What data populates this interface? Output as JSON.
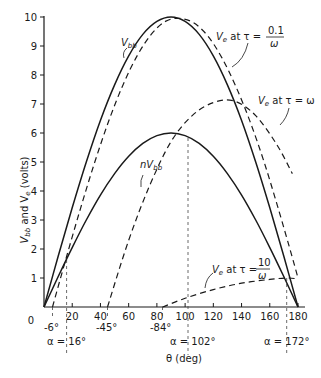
{
  "chart_data": {
    "type": "line",
    "title": "",
    "xlabel": "θ (deg)",
    "ylabel": "V_bb and V_e (volts)",
    "xlim": [
      0,
      180
    ],
    "ylim": [
      0,
      10
    ],
    "x_ticks": [
      0,
      20,
      40,
      60,
      80,
      100,
      120,
      140,
      160,
      180
    ],
    "y_ticks": [
      0,
      1,
      2,
      3,
      4,
      5,
      6,
      7,
      8,
      9,
      10
    ],
    "grid": false,
    "series": [
      {
        "name": "V_bb",
        "style": "solid",
        "x": [
          0,
          10,
          20,
          30,
          40,
          50,
          60,
          70,
          80,
          90,
          100,
          110,
          120,
          130,
          140,
          150,
          160,
          170,
          180
        ],
        "y": [
          0,
          1.74,
          3.42,
          5.0,
          6.43,
          7.66,
          8.66,
          9.4,
          9.85,
          10.0,
          9.85,
          9.4,
          8.66,
          7.66,
          6.43,
          5.0,
          3.42,
          1.74,
          0
        ]
      },
      {
        "name": "nV_bb",
        "style": "solid",
        "x": [
          0,
          10,
          20,
          30,
          40,
          50,
          60,
          70,
          80,
          90,
          100,
          110,
          120,
          130,
          140,
          150,
          160,
          170,
          180
        ],
        "y": [
          0,
          1.04,
          2.05,
          3.0,
          3.86,
          4.6,
          5.2,
          5.64,
          5.91,
          6.0,
          5.91,
          5.64,
          5.2,
          4.6,
          3.86,
          3.0,
          2.05,
          1.04,
          0
        ]
      },
      {
        "name": "V_e at τ = 0.1/ω",
        "style": "dashed",
        "x": [
          6,
          16,
          26,
          36,
          46,
          56,
          66,
          76,
          86,
          96,
          106,
          116,
          126,
          136,
          146,
          156,
          166,
          176,
          180
        ],
        "y": [
          0,
          1.74,
          3.42,
          5.0,
          6.43,
          7.66,
          8.66,
          9.4,
          9.85,
          9.95,
          9.8,
          9.35,
          8.6,
          7.6,
          6.4,
          5.0,
          3.4,
          1.7,
          1.0
        ]
      },
      {
        "name": "V_e at τ = ω",
        "style": "dashed",
        "x": [
          45,
          60,
          75,
          90,
          105,
          120,
          135,
          150,
          165,
          176
        ],
        "y": [
          0,
          2.3,
          4.2,
          5.7,
          6.6,
          7.05,
          7.1,
          6.6,
          5.6,
          4.6
        ]
      },
      {
        "name": "V_e at τ = 10/ω",
        "style": "dashed",
        "x": [
          84,
          100,
          120,
          140,
          160,
          172,
          180
        ],
        "y": [
          0,
          0.3,
          0.6,
          0.82,
          0.95,
          1.0,
          0.97
        ]
      }
    ],
    "annotations": [
      {
        "text": "V_bb",
        "target": "V_bb"
      },
      {
        "text": "nV_bb",
        "target": "nV_bb"
      },
      {
        "text": "V_e at τ = 0.1/ω",
        "target": "V_e at τ = 0.1/ω"
      },
      {
        "text": "V_e at τ = ω",
        "target": "V_e at τ = ω"
      },
      {
        "text": "V_e at τ = 10/ω",
        "target": "V_e at τ = 10/ω"
      },
      {
        "text": "-6°",
        "x": 6
      },
      {
        "text": "-45°",
        "x": 45
      },
      {
        "text": "-84°",
        "x": 84
      },
      {
        "text": "α = 16°",
        "x": 16
      },
      {
        "text": "α = 102°",
        "x": 102
      },
      {
        "text": "α = 172°",
        "x": 172
      }
    ]
  },
  "labels": {
    "ylabel_main": "V",
    "ylabel_sub1": "bb",
    "ylabel_mid": " and V",
    "ylabel_sub2": "e",
    "ylabel_end": " (volts)",
    "xlabel": "θ (deg)",
    "vbb": "V",
    "vbb_sub": "bb",
    "nvbb": "nV",
    "nvbb_sub": "bb",
    "ve01_a": "V",
    "ve01_sub": "e",
    "ve01_b": " at τ =",
    "ve01_num": "0.1",
    "ve01_den": "ω",
    "ve1_a": "V",
    "ve1_sub": "e",
    "ve1_b": " at τ = ω",
    "ve10_a": "V",
    "ve10_sub": "e",
    "ve10_b": " at τ =",
    "ve10_num": "10",
    "ve10_den": "ω",
    "phase_m6": "-6°",
    "phase_m45": "-45°",
    "phase_m84": "-84°",
    "alpha16": "α = 16°",
    "alpha102": "α = 102°",
    "alpha172": "α = 172°"
  },
  "ticks": {
    "y": [
      "0",
      "1",
      "2",
      "3",
      "4",
      "5",
      "6",
      "7",
      "8",
      "9",
      "10"
    ],
    "x": [
      "0",
      "20",
      "40",
      "60",
      "80",
      "100",
      "120",
      "140",
      "160",
      "180"
    ]
  }
}
